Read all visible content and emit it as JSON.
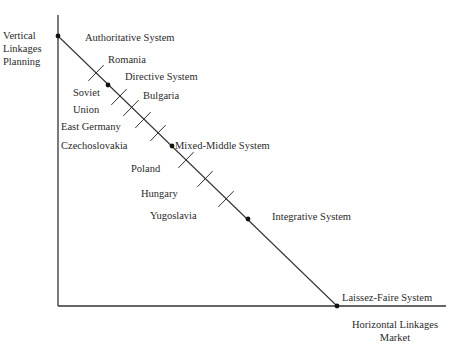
{
  "chart_data": {
    "type": "diagram",
    "title": "",
    "axes": {
      "y_label": [
        "Vertical",
        "Linkages",
        "Planning"
      ],
      "x_label": [
        "Horizontal Linkages",
        "Market"
      ]
    },
    "continuum": {
      "start": {
        "x": 58,
        "y": 36
      },
      "end": {
        "x": 337,
        "y": 306
      }
    },
    "systems": [
      {
        "label": "Authoritative System",
        "x": 58,
        "y": 36
      },
      {
        "label": "Directive System",
        "x": 108,
        "y": 85
      },
      {
        "label": "Mixed-Middle System",
        "x": 172,
        "y": 146
      },
      {
        "label": "Integrative System",
        "x": 248,
        "y": 219
      },
      {
        "label": "Laissez-Faire System",
        "x": 337,
        "y": 306
      }
    ],
    "countries": [
      {
        "label": "Romania",
        "x": 96,
        "y": 73
      },
      {
        "label": "Soviet Union",
        "x": 119,
        "y": 97
      },
      {
        "label": "Bulgaria",
        "x": 131,
        "y": 108
      },
      {
        "label": "East Germany",
        "x": 143,
        "y": 120
      },
      {
        "label": "Czechoslovakia",
        "x": 158,
        "y": 133
      },
      {
        "label": "Poland",
        "x": 186,
        "y": 160
      },
      {
        "label": "Hungary",
        "x": 205,
        "y": 179
      },
      {
        "label": "Yugoslavia",
        "x": 226,
        "y": 199
      }
    ]
  },
  "labels": {
    "y_axis_1": "Vertical",
    "y_axis_2": "Linkages",
    "y_axis_3": "Planning",
    "x_axis_1": "Horizontal Linkages",
    "x_axis_2": "Market",
    "authoritative": "Authoritative System",
    "directive": "Directive System",
    "mixed": "Mixed-Middle System",
    "integrative": "Integrative System",
    "laissez": "Laissez-Faire System",
    "romania": "Romania",
    "soviet_1": "Soviet",
    "soviet_2": "Union",
    "bulgaria": "Bulgaria",
    "east_germany": "East Germany",
    "czechoslovakia": "Czechoslovakia",
    "poland": "Poland",
    "hungary": "Hungary",
    "yugoslavia": "Yugoslavia"
  }
}
